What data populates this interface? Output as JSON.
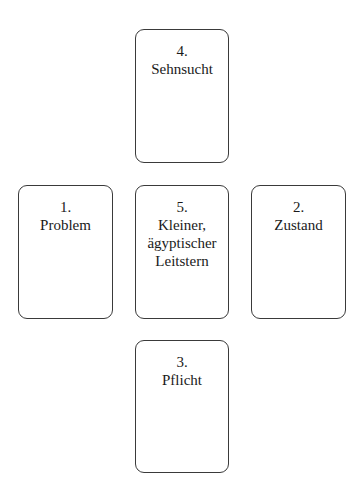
{
  "diagram": {
    "type": "tarot-spread",
    "layout": "cross",
    "cards": [
      {
        "position": "top",
        "number": "4.",
        "label": "Sehnsucht"
      },
      {
        "position": "left",
        "number": "1.",
        "label": "Problem"
      },
      {
        "position": "center",
        "number": "5.",
        "label": "Kleiner,\nägyptischer\nLeitstern"
      },
      {
        "position": "right",
        "number": "2.",
        "label": "Zustand"
      },
      {
        "position": "bottom",
        "number": "3.",
        "label": "Pflicht"
      }
    ],
    "colors": {
      "border": "#3a3a3a",
      "text": "#1a1a1a",
      "background": "#ffffff"
    }
  }
}
